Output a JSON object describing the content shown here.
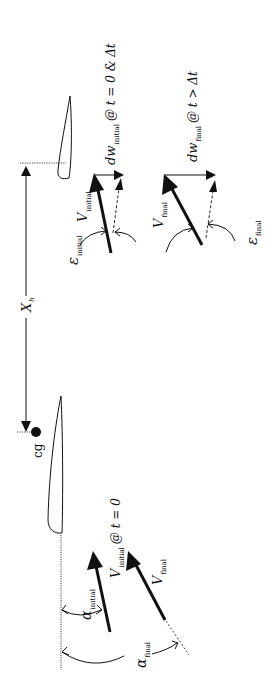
{
  "diagram": {
    "orientation": "rotated 90 degrees clockwise",
    "colors": {
      "ink": "#111111",
      "background": "#ffffff"
    },
    "labels": {
      "tail_arm": {
        "symbol": "X",
        "subscript": "h"
      },
      "cg": "cg",
      "v_initial_wing": {
        "symbol": "V",
        "subscript": "initial",
        "suffix": "@ t = 0"
      },
      "v_final_wing": {
        "symbol": "V",
        "subscript": "final"
      },
      "alpha_initial": {
        "symbol": "α",
        "subscript": "initial"
      },
      "alpha_final": {
        "symbol": "α",
        "subscript": "final"
      },
      "dw_initial": {
        "symbol": "dw",
        "subscript": "initial",
        "suffix": "@ t = 0 & Δt"
      },
      "dw_final": {
        "symbol": "dw",
        "subscript": "final",
        "suffix": "@ t > Δt"
      },
      "v_initial_tail": {
        "symbol": "V",
        "subscript": "initial"
      },
      "v_final_tail": {
        "symbol": "V",
        "subscript": "final"
      },
      "eps_initial": {
        "symbol": "ε",
        "subscript": "initial"
      },
      "eps_final": {
        "symbol": "ε",
        "subscript": "final"
      }
    }
  }
}
